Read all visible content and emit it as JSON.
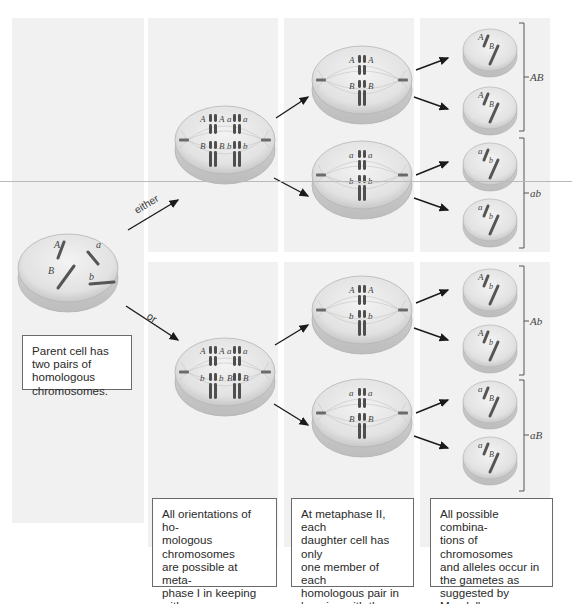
{
  "diagram": {
    "arrow_labels": {
      "either": "either",
      "or": "or"
    },
    "parent_cell": {
      "alleles": [
        "A",
        "a",
        "B",
        "b"
      ],
      "caption": "Parent cell has two pairs of homologous chromosomes."
    },
    "metaphase_I": {
      "top": {
        "row1": [
          "A",
          "A",
          "a",
          "a"
        ],
        "row2": [
          "B",
          "B",
          "b",
          "b"
        ]
      },
      "bottom": {
        "row1": [
          "A",
          "A",
          "a",
          "a"
        ],
        "row2": [
          "b",
          "b",
          "B",
          "B"
        ]
      },
      "caption": "All orientations of ho-\nmologous chromosomes\nare possible at meta-\nphase I in keeping with\nthe law of independent\nassortment."
    },
    "metaphase_II": {
      "cells": [
        {
          "row1": [
            "A",
            "A"
          ],
          "row2": [
            "B",
            "B"
          ]
        },
        {
          "row1": [
            "a",
            "a"
          ],
          "row2": [
            "b",
            "b"
          ]
        },
        {
          "row1": [
            "A",
            "A"
          ],
          "row2": [
            "b",
            "b"
          ]
        },
        {
          "row1": [
            "a",
            "a"
          ],
          "row2": [
            "B",
            "B"
          ]
        }
      ],
      "caption": "At metaphase II, each\ndaughter cell has only\none member of each\nhomologous pair in\nkeeping with the law of\nsegregation."
    },
    "gametes": {
      "cells": [
        {
          "top": "A",
          "bottom": "B"
        },
        {
          "top": "A",
          "bottom": "B"
        },
        {
          "top": "a",
          "bottom": "b"
        },
        {
          "top": "a",
          "bottom": "b"
        },
        {
          "top": "A",
          "bottom": "b"
        },
        {
          "top": "A",
          "bottom": "b"
        },
        {
          "top": "a",
          "bottom": "B"
        },
        {
          "top": "a",
          "bottom": "B"
        }
      ],
      "groups": [
        "AB",
        "ab",
        "Ab",
        "aB"
      ],
      "caption": "All possible combina-\ntions of chromosomes\nand alleles occur in\nthe gametes as\nsuggested by Mendel's\ntwo laws."
    },
    "colors": {
      "panel": "#f1f1f1",
      "cell_fill": "#e4e4e4",
      "cell_edge": "#b5b5b5",
      "chromosome": "#4e4e4e",
      "arrow": "#1a1a1a",
      "textbox_border": "#6a6a6a"
    }
  }
}
